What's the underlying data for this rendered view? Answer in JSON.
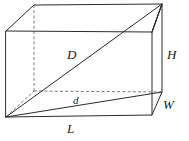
{
  "figure": {
    "name": "rectangular-prism-diagonals",
    "width": 189,
    "height": 141,
    "background_color": "#ffffff",
    "line_color": "#2b2b2b",
    "hidden_line_color": "#7a7a7a",
    "label_color": "#1c1c1c"
  },
  "labels": {
    "space_diagonal": "D",
    "base_diagonal": "d",
    "length": "L",
    "width": "W",
    "height": "H"
  },
  "label_positions": {
    "space_diagonal": {
      "x": 67,
      "y": 48
    },
    "base_diagonal": {
      "x": 73,
      "y": 95
    },
    "length": {
      "x": 67,
      "y": 122
    },
    "width": {
      "x": 163,
      "y": 98
    },
    "height": {
      "x": 167,
      "y": 48
    }
  },
  "geometry": {
    "front_top_left": {
      "x": 6,
      "y": 31
    },
    "front_top_right": {
      "x": 152,
      "y": 32
    },
    "front_bottom_right": {
      "x": 152,
      "y": 115
    },
    "front_bottom_left": {
      "x": 6,
      "y": 117
    },
    "back_top_left": {
      "x": 34,
      "y": 5
    },
    "back_top_right": {
      "x": 162,
      "y": 4
    },
    "back_bottom_right": {
      "x": 162,
      "y": 92
    },
    "back_bottom_left": {
      "x": 34,
      "y": 91
    }
  },
  "edges": {
    "front_face": "M 6 31 L 152 32 L 152 115 L 6 117 Z",
    "top_face": "M 6 31 L 34 5 L 162 4 L 152 32",
    "right_face": "M 152 32 L 162 4 L 162 92 L 152 115",
    "hidden_back_left_vertical": "M 34 5 L 34 91",
    "hidden_back_bottom_horizontal": "M 34 91 L 162 92",
    "hidden_bottom_left_to_back": "M 6 117 L 34 91"
  },
  "diagonals": {
    "space_diagonal_path": "M 6 117 L 162 4",
    "base_diagonal_path": "M 6 117 L 162 92",
    "top_right_helper_path": "M 152 32 L 162 4"
  }
}
